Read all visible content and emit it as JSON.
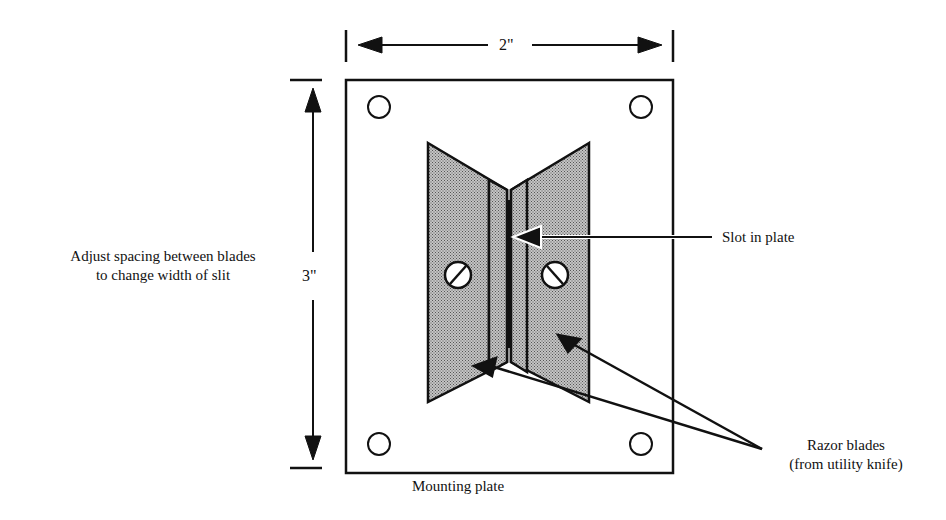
{
  "dimensions": {
    "width": "2\"",
    "height": "3\""
  },
  "labels": {
    "adjust_line1": "Adjust spacing between blades",
    "adjust_line2": "to change width of slit",
    "slot": "Slot in plate",
    "razor_line1": "Razor blades",
    "razor_line2": "(from utility knife)",
    "mounting_plate": "Mounting plate"
  },
  "colors": {
    "ink": "#111111",
    "blade_fill": "#a8a8a8",
    "slot_fill": "#111111"
  }
}
